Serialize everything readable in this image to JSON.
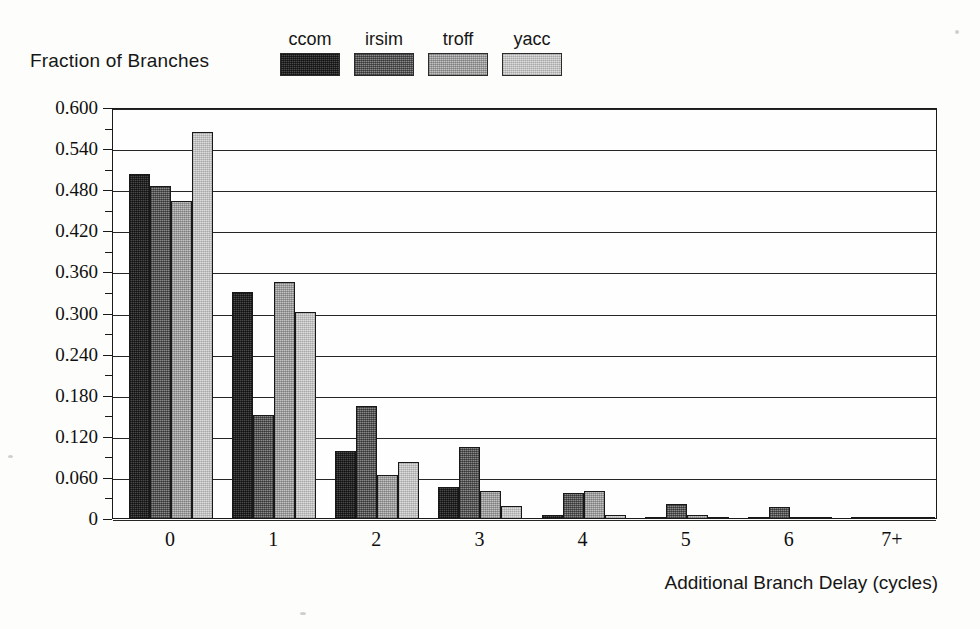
{
  "axes": {
    "y_title": "Fraction of Branches",
    "x_title": "Additional Branch Delay (cycles)",
    "y_labels": [
      "0.600",
      "0.540",
      "0.480",
      "0.420",
      "0.360",
      "0.300",
      "0.240",
      "0.180",
      "0.120",
      "0.060",
      "0"
    ],
    "x_labels": [
      "0",
      "1",
      "2",
      "3",
      "4",
      "5",
      "6",
      "7+"
    ]
  },
  "legend": {
    "items": [
      {
        "label": "ccom",
        "color": "#4a4a4a",
        "key": "ccom"
      },
      {
        "label": "irsim",
        "color": "#8a8a8a",
        "key": "irsim"
      },
      {
        "label": "troff",
        "color": "#c2c2c2",
        "key": "troff"
      },
      {
        "label": "yacc",
        "color": "#dcdcdc",
        "key": "yacc"
      }
    ]
  },
  "chart_data": {
    "type": "bar",
    "title": "",
    "xlabel": "Additional Branch Delay (cycles)",
    "ylabel": "Fraction of Branches",
    "categories": [
      "0",
      "1",
      "2",
      "3",
      "4",
      "5",
      "6",
      "7+"
    ],
    "ylim": [
      0,
      0.6
    ],
    "ytick_step": 0.06,
    "yminor_step": 0.03,
    "grid": "horizontal",
    "legend_position": "top",
    "series": [
      {
        "name": "ccom",
        "color": "#4a4a4a",
        "values": [
          0.502,
          0.33,
          0.098,
          0.046,
          0.004,
          0.001,
          0.0,
          0.001
        ]
      },
      {
        "name": "irsim",
        "color": "#8a8a8a",
        "values": [
          0.485,
          0.15,
          0.163,
          0.103,
          0.037,
          0.02,
          0.016,
          0.002
        ]
      },
      {
        "name": "troff",
        "color": "#c2c2c2",
        "values": [
          0.463,
          0.345,
          0.063,
          0.04,
          0.04,
          0.004,
          0.002,
          0.001
        ]
      },
      {
        "name": "yacc",
        "color": "#dcdcdc",
        "values": [
          0.564,
          0.301,
          0.082,
          0.017,
          0.005,
          0.002,
          0.0,
          0.0
        ]
      }
    ]
  }
}
